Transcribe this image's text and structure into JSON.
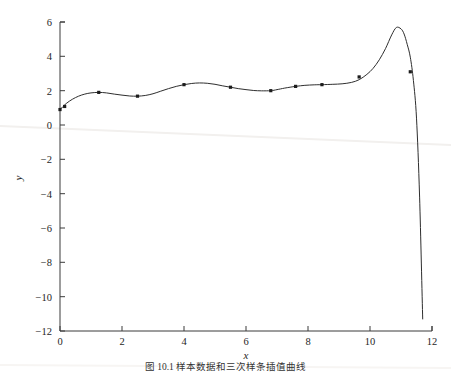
{
  "figure": {
    "background_color": "#ffffff",
    "curve_color": "#2e2e2e",
    "marker_color": "#1c1c1c",
    "axis_color": "#3b3b3b",
    "scan_artifact_color": "#f2f0ee",
    "caption": "图 10.1   样本数据和三次样条插值曲线"
  },
  "chart_data": {
    "type": "line",
    "title": "",
    "subtitle": "",
    "xlabel": "x",
    "ylabel": "y",
    "xlim": [
      0,
      12
    ],
    "ylim": [
      -12,
      6
    ],
    "xticks": [
      0,
      2,
      4,
      6,
      8,
      10,
      12
    ],
    "xtick_labels": [
      "0",
      "2",
      "4",
      "6",
      "8",
      "10",
      "12"
    ],
    "yticks": [
      6,
      4,
      2,
      0,
      -2,
      -4,
      -6,
      -8,
      -10,
      -12
    ],
    "ytick_labels": [
      "6",
      "4",
      "2",
      "0",
      "−2",
      "−4",
      "−6",
      "−8",
      "−10",
      "−12"
    ],
    "grid": false,
    "legend": null,
    "legend_position": "none",
    "annotations": [],
    "series": [
      {
        "name": "cubic-spline-curve",
        "kind": "line",
        "marker": "none",
        "color": "#2e2e2e",
        "x": [
          0.0,
          0.2,
          0.4,
          0.6,
          0.8,
          1.0,
          1.25,
          1.5,
          1.75,
          2.0,
          2.25,
          2.5,
          2.75,
          3.0,
          3.25,
          3.5,
          3.75,
          4.0,
          4.25,
          4.5,
          4.75,
          5.0,
          5.25,
          5.5,
          5.75,
          6.0,
          6.25,
          6.5,
          6.8,
          7.0,
          7.25,
          7.6,
          7.9,
          8.2,
          8.45,
          8.8,
          9.1,
          9.4,
          9.65,
          9.9,
          10.1,
          10.3,
          10.5,
          10.7,
          10.85,
          11.0,
          11.1,
          11.2,
          11.3,
          11.4,
          11.5,
          11.6,
          11.7
        ],
        "y": [
          0.9,
          1.25,
          1.5,
          1.68,
          1.8,
          1.87,
          1.9,
          1.87,
          1.8,
          1.74,
          1.69,
          1.68,
          1.72,
          1.82,
          1.97,
          2.12,
          2.25,
          2.35,
          2.42,
          2.45,
          2.43,
          2.37,
          2.28,
          2.2,
          2.12,
          2.06,
          2.01,
          1.99,
          2.0,
          2.06,
          2.15,
          2.25,
          2.31,
          2.34,
          2.35,
          2.37,
          2.4,
          2.48,
          2.64,
          2.95,
          3.3,
          3.8,
          4.45,
          5.25,
          5.68,
          5.6,
          5.3,
          4.7,
          3.95,
          2.6,
          0.4,
          -4.2,
          -11.3
        ]
      },
      {
        "name": "sample-data-points",
        "kind": "scatter",
        "marker": "square",
        "color": "#1c1c1c",
        "x": [
          0.0,
          0.15,
          1.25,
          2.5,
          4.0,
          5.5,
          6.8,
          7.6,
          8.45,
          9.65,
          11.3
        ],
        "y": [
          0.9,
          1.08,
          1.9,
          1.68,
          2.35,
          2.2,
          2.0,
          2.25,
          2.35,
          2.8,
          3.1
        ]
      }
    ]
  }
}
